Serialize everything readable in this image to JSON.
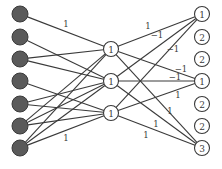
{
  "diagram": {
    "type": "neural-network",
    "input_nodes": [
      {
        "id": "i1",
        "x": 20,
        "y": 14
      },
      {
        "id": "i2",
        "x": 20,
        "y": 37
      },
      {
        "id": "i3",
        "x": 20,
        "y": 59
      },
      {
        "id": "i4",
        "x": 20,
        "y": 81
      },
      {
        "id": "i5",
        "x": 20,
        "y": 104
      },
      {
        "id": "i6",
        "x": 20,
        "y": 126
      },
      {
        "id": "i7",
        "x": 20,
        "y": 148
      }
    ],
    "hidden_nodes": [
      {
        "id": "h1",
        "x": 111,
        "y": 49,
        "label": "1"
      },
      {
        "id": "h2",
        "x": 111,
        "y": 81,
        "label": "1"
      },
      {
        "id": "h3",
        "x": 111,
        "y": 113,
        "label": "1"
      }
    ],
    "output_nodes": [
      {
        "id": "o1",
        "x": 202,
        "y": 14,
        "label": "1"
      },
      {
        "id": "o2",
        "x": 202,
        "y": 37,
        "label": "2"
      },
      {
        "id": "o3",
        "x": 202,
        "y": 59,
        "label": "2"
      },
      {
        "id": "o4",
        "x": 202,
        "y": 81,
        "label": "1"
      },
      {
        "id": "o5",
        "x": 202,
        "y": 104,
        "label": "2"
      },
      {
        "id": "o6",
        "x": 202,
        "y": 126,
        "label": "2"
      },
      {
        "id": "o7",
        "x": 202,
        "y": 148,
        "label": "3"
      }
    ],
    "edges": [
      {
        "from": "i1",
        "to": "h1",
        "weight": "1",
        "lx": 66,
        "ly": 27
      },
      {
        "from": "i2",
        "to": "h2",
        "weight": ""
      },
      {
        "from": "i3",
        "to": "h1",
        "weight": ""
      },
      {
        "from": "i3",
        "to": "h2",
        "weight": ""
      },
      {
        "from": "i4",
        "to": "h3",
        "weight": ""
      },
      {
        "from": "i5",
        "to": "h2",
        "weight": ""
      },
      {
        "from": "i5",
        "to": "h3",
        "weight": ""
      },
      {
        "from": "i6",
        "to": "h1",
        "weight": ""
      },
      {
        "from": "i6",
        "to": "h2",
        "weight": ""
      },
      {
        "from": "i6",
        "to": "h3",
        "weight": ""
      },
      {
        "from": "i7",
        "to": "h1",
        "weight": ""
      },
      {
        "from": "i7",
        "to": "h2",
        "weight": ""
      },
      {
        "from": "i7",
        "to": "h3",
        "weight": "1",
        "lx": 66,
        "ly": 141
      },
      {
        "from": "h1",
        "to": "o1",
        "weight": "1",
        "lx": 148,
        "ly": 29
      },
      {
        "from": "h2",
        "to": "o1",
        "weight": "−1",
        "lx": 157,
        "ly": 38
      },
      {
        "from": "h3",
        "to": "o1",
        "weight": "−1",
        "lx": 173,
        "ly": 52
      },
      {
        "from": "h1",
        "to": "o4",
        "weight": "−1",
        "lx": 181,
        "ly": 72
      },
      {
        "from": "h2",
        "to": "o4",
        "weight": "−1",
        "lx": 175,
        "ly": 80
      },
      {
        "from": "h3",
        "to": "o4",
        "weight": "1",
        "lx": 178,
        "ly": 98
      },
      {
        "from": "h1",
        "to": "o7",
        "weight": "1",
        "lx": 170,
        "ly": 114
      },
      {
        "from": "h2",
        "to": "o7",
        "weight": "1",
        "lx": 156,
        "ly": 127
      },
      {
        "from": "h3",
        "to": "o7",
        "weight": "1",
        "lx": 146,
        "ly": 138
      }
    ]
  }
}
